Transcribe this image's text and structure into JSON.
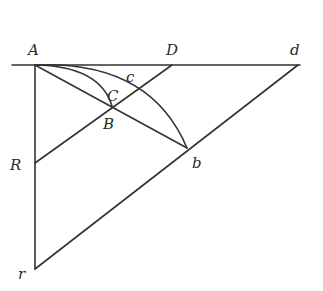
{
  "diagram": {
    "type": "geometric construction",
    "points": {
      "A": {
        "label": "A",
        "x": 35,
        "y": 65
      },
      "D": {
        "label": "D",
        "x": 172,
        "y": 65
      },
      "d": {
        "label": "d",
        "x": 298,
        "y": 65
      },
      "B": {
        "label": "B",
        "x": 112,
        "y": 106
      },
      "b": {
        "label": "b",
        "x": 187,
        "y": 148
      },
      "C": {
        "label": "C",
        "x": 112,
        "y": 95
      },
      "c": {
        "label": "c",
        "x": 128,
        "y": 80
      },
      "R": {
        "label": "R",
        "x": 35,
        "y": 163
      },
      "r": {
        "label": "r",
        "x": 35,
        "y": 269
      }
    },
    "segments": [
      {
        "from": "left-edge",
        "to": "d",
        "desc": "horizontal line through A, D, d"
      },
      {
        "from": "A",
        "to": "r",
        "desc": "vertical line through R"
      },
      {
        "from": "A",
        "to": "b",
        "desc": "straight line through B"
      },
      {
        "from": "R",
        "to": "D"
      },
      {
        "from": "r",
        "to": "d"
      }
    ],
    "curves": [
      {
        "from": "A",
        "to": "B",
        "via": "C",
        "desc": "small arc"
      },
      {
        "from": "A",
        "to": "b",
        "via": "c",
        "desc": "large arc"
      }
    ],
    "colors": {
      "ink": "#333333",
      "background": "#ffffff"
    }
  }
}
